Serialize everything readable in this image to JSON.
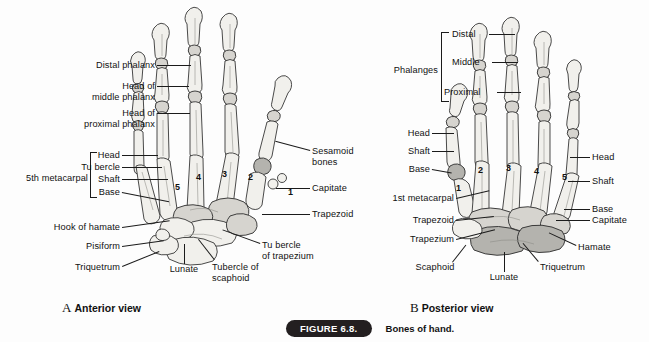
{
  "figure": {
    "number_label": "FIGURE 6.8.",
    "caption": "Bones of hand."
  },
  "panels": [
    {
      "id": "A",
      "letter": "A",
      "view_name": "Anterior view",
      "metacarpal_numbers": [
        "5",
        "4",
        "3",
        "2",
        "1"
      ],
      "labels": [
        "Distal phalanx",
        "Head of",
        "middle phalanx",
        "Head of",
        "proximal phalanx",
        "5th metacarpal",
        "Head",
        "Tu bercle",
        "Shaft",
        "Base",
        "Hook of hamate",
        "Pisiform",
        "Triquetrum",
        "Lunate",
        "Tubercle of",
        "scaphoid",
        "Sesamoid",
        "bones",
        "Capitate",
        "Trapezoid",
        "Tu bercle",
        "of trapezium"
      ]
    },
    {
      "id": "B",
      "letter": "B",
      "view_name": "Posterior view",
      "metacarpal_numbers": [
        "1",
        "2",
        "3",
        "4",
        "5"
      ],
      "labels": [
        "Phalanges",
        "Distal",
        "Middle",
        "Proximal",
        "Head",
        "Shaft",
        "Base",
        "1st metacarpal",
        "Trapezoid",
        "Trapezium",
        "Scaphoid",
        "Lunate",
        "Triquetrum",
        "Hamate",
        "Capitate"
      ]
    }
  ],
  "panel_a": {
    "distal_phalanx": "Distal phalanx",
    "head_of": "Head of",
    "middle_phalanx": "middle phalanx",
    "head_of_2": "Head of",
    "proximal_phalanx": "proximal phalanx",
    "fifth_metacarpal": "5th metacarpal",
    "head": "Head",
    "tubercle": "Tu bercle",
    "shaft": "Shaft",
    "base": "Base",
    "hook_of_hamate": "Hook of hamate",
    "pisiform": "Pisiform",
    "triquetrum": "Triquetrum",
    "lunate": "Lunate",
    "tubercle_of": "Tubercle of",
    "scaphoid": "scaphoid",
    "sesamoid": "Sesamoid",
    "bones": "bones",
    "capitate": "Capitate",
    "trapezoid": "Trapezoid",
    "tubercle2": "Tu bercle",
    "of_trapezium": "of trapezium",
    "num5": "5",
    "num4": "4",
    "num3": "3",
    "num2": "2",
    "num1": "1",
    "letter": "A",
    "view_name": "Anterior view"
  },
  "panel_b": {
    "phalanges": "Phalanges",
    "distal": "Distal",
    "middle": "Middle",
    "proximal": "Proximal",
    "head_l": "Head",
    "shaft_l": "Shaft",
    "base_l": "Base",
    "first_metacarpal": "1st metacarpal",
    "trapezoid": "Trapezoid",
    "trapezium": "Trapezium",
    "scaphoid": "Scaphoid",
    "lunate": "Lunate",
    "triquetrum": "Triquetrum",
    "hamate": "Hamate",
    "capitate": "Capitate",
    "head_r": "Head",
    "shaft_r": "Shaft",
    "base_r": "Base",
    "num1": "1",
    "num2": "2",
    "num3": "3",
    "num4": "4",
    "num5": "5",
    "letter": "B",
    "view_name": "Posterior view"
  },
  "colors": {
    "background": "#fdfdfd",
    "text": "#111111",
    "leader_line": "#1b1b1b",
    "pill_bg": "#231f20",
    "pill_text": "#ffffff",
    "bone_light": "#e9e8e4",
    "bone_dark": "#b4b3ae"
  }
}
